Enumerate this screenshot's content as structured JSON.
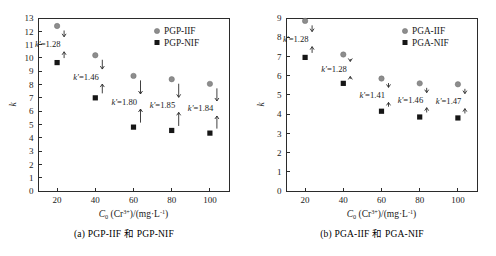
{
  "figure": {
    "panels": [
      {
        "id": "a",
        "caption": "(a) PGP-IIF 和 PGP-NIF",
        "legend": [
          {
            "label": "PGP-IIF",
            "marker": "circle-icon",
            "color": "#8d8d8d"
          },
          {
            "label": "PGP-NIF",
            "marker": "square-icon",
            "color": "#161616"
          }
        ]
      },
      {
        "id": "b",
        "caption": "(b) PGA-IIF 和 PGA-NIF",
        "legend": [
          {
            "label": "PGA-IIF",
            "marker": "circle-icon",
            "color": "#8d8d8d"
          },
          {
            "label": "PGA-NIF",
            "marker": "square-icon",
            "color": "#161616"
          }
        ]
      }
    ]
  },
  "chart_data": [
    {
      "type": "scatter",
      "panel": "a",
      "title": "(a) PGP-IIF 和 PGP-NIF",
      "xlabel_parts": {
        "main": "C",
        "sub": "0",
        "paren": "(Cr",
        "charge": "3+",
        "rest": ")/(mg·L",
        "unit_exp": "-1",
        "close": ")"
      },
      "xlabel": "C0(Cr3+)/(mg·L-1)",
      "ylabel": "k",
      "x": [
        20,
        40,
        60,
        80,
        100
      ],
      "xticks": [
        20,
        40,
        60,
        80,
        100
      ],
      "yticks": [
        0,
        1,
        2,
        3,
        4,
        5,
        6,
        7,
        8,
        9,
        10,
        11,
        12,
        13
      ],
      "xlim": [
        10,
        110
      ],
      "ylim": [
        0,
        13
      ],
      "grid": false,
      "legend_position": "top-right",
      "series": [
        {
          "name": "PGP-IIF",
          "marker": "circle",
          "color": "#8d8d8d",
          "values": [
            12.4,
            10.2,
            8.65,
            8.4,
            8.05
          ]
        },
        {
          "name": "PGP-NIF",
          "marker": "square",
          "color": "#161616",
          "values": [
            9.65,
            7.0,
            4.8,
            4.55,
            4.35
          ]
        }
      ],
      "annotations": [
        {
          "x": 20,
          "text": "k'=1.28",
          "symbol": "k'",
          "value": "1.28"
        },
        {
          "x": 40,
          "text": "k'=1.46",
          "symbol": "k'",
          "value": "1.46"
        },
        {
          "x": 60,
          "text": "k'=1.80",
          "symbol": "k'",
          "value": "1.80"
        },
        {
          "x": 80,
          "text": "k'=1.85",
          "symbol": "k'",
          "value": "1.85"
        },
        {
          "x": 100,
          "text": "k'=1.84",
          "symbol": "k'",
          "value": "1.84"
        }
      ]
    },
    {
      "type": "scatter",
      "panel": "b",
      "title": "(b) PGA-IIF 和 PGA-NIF",
      "xlabel_parts": {
        "main": "C",
        "sub": "0",
        "paren": "(Cr",
        "charge": "3+",
        "rest": ")/(mg·L",
        "unit_exp": "-1",
        "close": ")"
      },
      "xlabel": "C0(Cr3+)/(mg·L-1)",
      "ylabel": "k",
      "x": [
        20,
        40,
        60,
        80,
        100
      ],
      "xticks": [
        20,
        40,
        60,
        80,
        100
      ],
      "yticks": [
        0,
        1,
        2,
        3,
        4,
        5,
        6,
        7,
        8,
        9
      ],
      "xlim": [
        10,
        110
      ],
      "ylim": [
        0,
        9
      ],
      "grid": false,
      "legend_position": "top-right",
      "series": [
        {
          "name": "PGA-IIF",
          "marker": "circle",
          "color": "#8d8d8d",
          "values": [
            8.85,
            7.1,
            5.85,
            5.6,
            5.55
          ]
        },
        {
          "name": "PGA-NIF",
          "marker": "square",
          "color": "#161616",
          "values": [
            6.95,
            5.6,
            4.15,
            3.85,
            3.8
          ]
        }
      ],
      "annotations": [
        {
          "x": 20,
          "text": "k'=1.28",
          "symbol": "k'",
          "value": "1.28"
        },
        {
          "x": 40,
          "text": "k'=1.28",
          "symbol": "k'",
          "value": "1.28"
        },
        {
          "x": 60,
          "text": "k'=1.41",
          "symbol": "k'",
          "value": "1.41"
        },
        {
          "x": 80,
          "text": "k'=1.46",
          "symbol": "k'",
          "value": "1.46"
        },
        {
          "x": 100,
          "text": "k'=1.47",
          "symbol": "k'",
          "value": "1.47"
        }
      ]
    }
  ]
}
